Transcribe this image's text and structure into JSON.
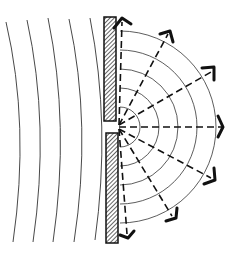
{
  "diagram": {
    "colors": {
      "background": "#ffffff",
      "ink": "#111111",
      "thin_line": "#333333"
    },
    "incident_wavefronts": {
      "count": 5,
      "label": "plane-wavefronts"
    },
    "barrier": {
      "label": "barrier-with-slit",
      "pattern": "hatched"
    },
    "diffracted_wavefronts": {
      "count": 5,
      "label": "circular-wavefronts"
    },
    "rays": {
      "count": 7,
      "style": "dashed-with-arrowheads"
    }
  }
}
